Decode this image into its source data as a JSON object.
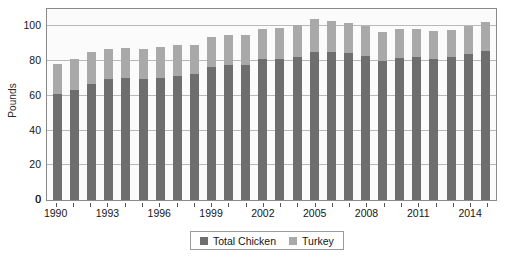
{
  "chart_data": {
    "type": "bar",
    "subtype": "stacked-bar",
    "title": "",
    "xlabel": "",
    "ylabel": "Pounds",
    "ylim": [
      0,
      110
    ],
    "yticks": [
      0,
      20,
      40,
      60,
      80,
      100
    ],
    "grid": true,
    "legend_position": "bottom-center",
    "categories": [
      "1990",
      "1991",
      "1992",
      "1993",
      "1994",
      "1995",
      "1996",
      "1997",
      "1998",
      "1999",
      "2000",
      "2001",
      "2002",
      "2003",
      "2004",
      "2005",
      "2006",
      "2007",
      "2008",
      "2009",
      "2010",
      "2011",
      "2012",
      "2013",
      "2014",
      "2015"
    ],
    "xtick_labels": [
      "1990",
      "1993",
      "1996",
      "1999",
      "2002",
      "2005",
      "2008",
      "2011",
      "2014"
    ],
    "series": [
      {
        "name": "Total Chicken",
        "color": "#6e6e6e",
        "values": [
          61,
          63.5,
          67,
          69.5,
          70,
          69.5,
          70,
          71.5,
          72.5,
          76.5,
          77.5,
          77.5,
          81,
          81.5,
          82.5,
          85,
          85.5,
          84.5,
          83,
          80,
          82,
          82.5,
          81.5,
          82.5,
          84,
          86
        ]
      },
      {
        "name": "Turkey",
        "color": "#a9a9a9",
        "values": [
          17.5,
          18,
          18,
          17.5,
          17.5,
          17.5,
          18,
          17.5,
          17,
          17.5,
          17.5,
          17.5,
          17.5,
          17.5,
          18.5,
          19,
          17.5,
          17.5,
          17.5,
          16.5,
          16.5,
          16,
          16,
          15.5,
          16,
          16.5
        ]
      }
    ],
    "totals": [
      78.5,
      81.5,
      85,
      87,
      87.5,
      87,
      88,
      89,
      89.5,
      94,
      95,
      95,
      98.5,
      99,
      101,
      104,
      103,
      102,
      100.5,
      96.5,
      98.5,
      98.5,
      97.5,
      98,
      100,
      102.5
    ]
  },
  "legend": {
    "items": [
      {
        "label": "Total Chicken"
      },
      {
        "label": "Turkey"
      }
    ]
  }
}
